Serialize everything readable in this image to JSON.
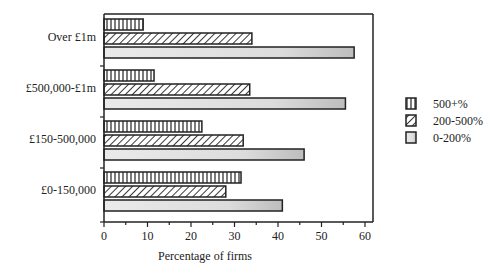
{
  "chart_data": {
    "type": "bar",
    "orientation": "horizontal",
    "title": "",
    "xlabel": "Percentage of firms",
    "ylabel": "",
    "xlim": [
      0,
      60
    ],
    "xticks": [
      0,
      10,
      20,
      30,
      40,
      50,
      60
    ],
    "grid": false,
    "legend_position": "right",
    "categories": [
      "Over £1m",
      "£500,000-£1m",
      "£150-500,000",
      "£0-150,000"
    ],
    "series": [
      {
        "name": "500+%",
        "pattern": "vertical-lines",
        "values": [
          9,
          11.5,
          22.5,
          31.5
        ]
      },
      {
        "name": "200-500%",
        "pattern": "diagonal-hatch",
        "values": [
          34,
          33.5,
          32,
          28
        ]
      },
      {
        "name": "0-200%",
        "pattern": "gray-fill",
        "values": [
          57.5,
          55.5,
          46,
          41
        ]
      }
    ]
  }
}
